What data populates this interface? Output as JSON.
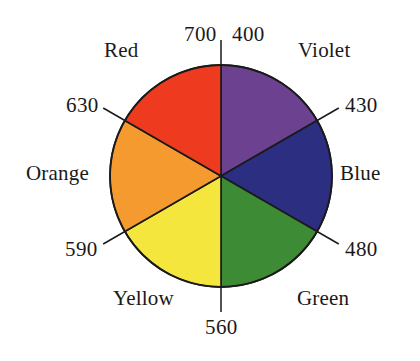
{
  "figure": {
    "background_color": "#ffffff",
    "outline_color": "#1a1a1a",
    "text_color": "#1a1a1a"
  },
  "chart_data": {
    "type": "pie",
    "title": "",
    "xlabel": "",
    "ylabel": "",
    "legend_position": "around-perimeter",
    "grid": false,
    "categories": [
      "Violet",
      "Blue",
      "Green",
      "Yellow",
      "Orange",
      "Red"
    ],
    "values": [
      60,
      60,
      60,
      60,
      60,
      60
    ],
    "slice_unit": "degrees",
    "series": [
      {
        "name": "Spectral sectors",
        "values": [
          60,
          60,
          60,
          60,
          60,
          60
        ]
      }
    ],
    "slices": [
      {
        "label": "Violet",
        "color": "#6B4190",
        "start_angle_deg": 0,
        "end_angle_deg": 60,
        "start_wavelength_nm": 400,
        "end_wavelength_nm": 430
      },
      {
        "label": "Blue",
        "color": "#2C2E82",
        "start_angle_deg": 60,
        "end_angle_deg": 120,
        "start_wavelength_nm": 430,
        "end_wavelength_nm": 480
      },
      {
        "label": "Green",
        "color": "#3D8B35",
        "start_angle_deg": 120,
        "end_angle_deg": 180,
        "start_wavelength_nm": 480,
        "end_wavelength_nm": 560
      },
      {
        "label": "Yellow",
        "color": "#F5E63E",
        "start_angle_deg": 180,
        "end_angle_deg": 240,
        "start_wavelength_nm": 560,
        "end_wavelength_nm": 590
      },
      {
        "label": "Orange",
        "color": "#F59A2E",
        "start_angle_deg": 240,
        "end_angle_deg": 300,
        "start_wavelength_nm": 590,
        "end_wavelength_nm": 630
      },
      {
        "label": "Red",
        "color": "#EE3A1E",
        "start_angle_deg": 300,
        "end_angle_deg": 360,
        "start_wavelength_nm": 630,
        "end_wavelength_nm": 700
      }
    ],
    "tick_labels": [
      {
        "value": "700",
        "unit": "nm",
        "angle_deg": 0,
        "position": "top-left"
      },
      {
        "value": "400",
        "unit": "nm",
        "angle_deg": 0,
        "position": "top-right"
      },
      {
        "value": "430",
        "unit": "nm",
        "angle_deg": 60,
        "position": "upper-right"
      },
      {
        "value": "480",
        "unit": "nm",
        "angle_deg": 120,
        "position": "lower-right"
      },
      {
        "value": "560",
        "unit": "nm",
        "angle_deg": 180,
        "position": "bottom"
      },
      {
        "value": "590",
        "unit": "nm",
        "angle_deg": 240,
        "position": "lower-left"
      },
      {
        "value": "630",
        "unit": "nm",
        "angle_deg": 300,
        "position": "upper-left"
      }
    ]
  },
  "labels": {
    "color_names": {
      "red": "Red",
      "violet": "Violet",
      "blue": "Blue",
      "green": "Green",
      "yellow": "Yellow",
      "orange": "Orange"
    },
    "wavelengths": {
      "w700": "700",
      "w400": "400",
      "w430": "430",
      "w480": "480",
      "w560": "560",
      "w590": "590",
      "w630": "630"
    }
  }
}
